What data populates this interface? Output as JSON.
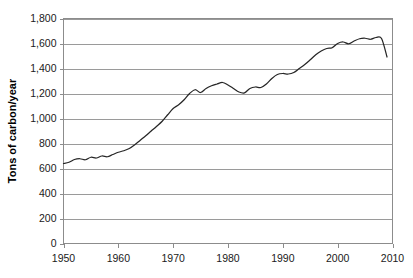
{
  "chart_data": {
    "type": "line",
    "title": "",
    "xlabel": "",
    "ylabel": "Tons of carbon/year",
    "xlim": [
      1950,
      2010
    ],
    "ylim": [
      0,
      1800
    ],
    "grid": true,
    "legend": "none",
    "xticks": [
      "1950",
      "1960",
      "1970",
      "1980",
      "1990",
      "2000",
      "2010"
    ],
    "xtick_values": [
      1950,
      1960,
      1970,
      1980,
      1990,
      2000,
      2010
    ],
    "yticks": [
      "0",
      "200",
      "400",
      "600",
      "800",
      "1,000",
      "1,200",
      "1,400",
      "1,600",
      "1,800"
    ],
    "ytick_values": [
      0,
      200,
      400,
      600,
      800,
      1000,
      1200,
      1400,
      1600,
      1800
    ],
    "line_color": "#262626",
    "gridline_color": "#9a9a9a",
    "x": [
      1950,
      1951,
      1952,
      1953,
      1954,
      1955,
      1956,
      1957,
      1958,
      1959,
      1960,
      1961,
      1962,
      1963,
      1964,
      1965,
      1966,
      1967,
      1968,
      1969,
      1970,
      1971,
      1972,
      1973,
      1974,
      1975,
      1976,
      1977,
      1978,
      1979,
      1980,
      1981,
      1982,
      1983,
      1984,
      1985,
      1986,
      1987,
      1988,
      1989,
      1990,
      1991,
      1992,
      1993,
      1994,
      1995,
      1996,
      1997,
      1998,
      1999,
      2000,
      2001,
      2002,
      2003,
      2004,
      2005,
      2006,
      2007,
      2008,
      2009
    ],
    "values": [
      640,
      650,
      672,
      678,
      670,
      690,
      684,
      700,
      694,
      712,
      730,
      742,
      760,
      790,
      826,
      862,
      900,
      938,
      978,
      1030,
      1080,
      1110,
      1150,
      1200,
      1230,
      1208,
      1240,
      1262,
      1276,
      1288,
      1268,
      1240,
      1212,
      1205,
      1240,
      1252,
      1248,
      1276,
      1320,
      1352,
      1360,
      1356,
      1368,
      1400,
      1432,
      1470,
      1510,
      1540,
      1560,
      1566,
      1600,
      1612,
      1598,
      1620,
      1638,
      1642,
      1634,
      1648,
      1640,
      1492
    ]
  }
}
